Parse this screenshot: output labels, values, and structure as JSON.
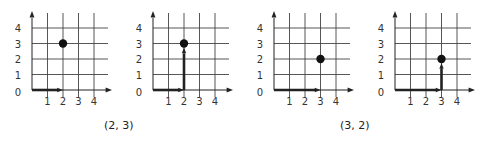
{
  "figure": {
    "colors": {
      "grid": "#444444",
      "axis": "#222222",
      "point": "#111111",
      "text": "#333333"
    },
    "axis": {
      "x_ticks": [
        "1",
        "2",
        "3",
        "4"
      ],
      "y_ticks": [
        "0",
        "1",
        "2",
        "3",
        "4"
      ]
    },
    "panels": [
      {
        "id": "p1",
        "point": [
          2,
          3
        ],
        "vector_x": 2,
        "vector_y": 0
      },
      {
        "id": "p2",
        "point": [
          2,
          3
        ],
        "vector_x": 2,
        "vector_y": 3
      },
      {
        "id": "p3",
        "point": [
          3,
          2
        ],
        "vector_x": 3,
        "vector_y": 0
      },
      {
        "id": "p4",
        "point": [
          3,
          2
        ],
        "vector_x": 3,
        "vector_y": 2
      }
    ],
    "captions": [
      {
        "label": "(2, 3)"
      },
      {
        "label": "(3, 2)"
      }
    ]
  }
}
